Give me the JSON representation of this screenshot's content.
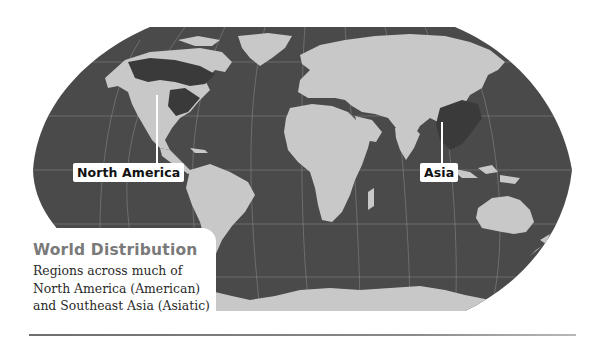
{
  "map": {
    "projection": "Robinson",
    "colors": {
      "ocean": "#4a4a4a",
      "land": "#c8c8c8",
      "range": "#3a3a3a",
      "graticule": "#8a8a8a",
      "label_bg": "#ffffff"
    },
    "labels": [
      {
        "id": "north-america",
        "text": "North America"
      },
      {
        "id": "asia",
        "text": "Asia"
      }
    ]
  },
  "caption": {
    "title": "World Distribution",
    "lines": [
      "Regions across much of",
      "North America (American)",
      "and Southeast Asia (Asiatic)"
    ]
  }
}
